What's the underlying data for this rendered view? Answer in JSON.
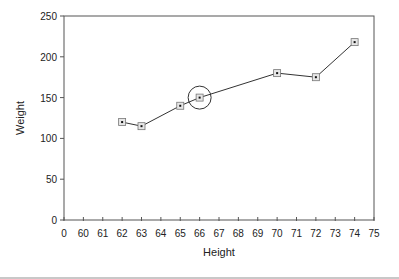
{
  "chart_data": {
    "type": "line",
    "title": "",
    "xlabel": "Height",
    "ylabel": "Weight",
    "x_tick_labels": [
      "0",
      "60",
      "61",
      "62",
      "63",
      "64",
      "65",
      "66",
      "67",
      "68",
      "69",
      "70",
      "71",
      "72",
      "73",
      "74",
      "75"
    ],
    "y_ticks": [
      0,
      50,
      100,
      150,
      200,
      250
    ],
    "ylim": [
      0,
      250
    ],
    "grid": false,
    "legend": null,
    "series": [
      {
        "name": "Weight vs Height",
        "marker": "square",
        "x": [
          62,
          63,
          65,
          66,
          70,
          72,
          74
        ],
        "y": [
          120,
          115,
          140,
          150,
          180,
          175,
          218
        ]
      }
    ],
    "annotations": [
      {
        "type": "circle",
        "x": 66,
        "y": 150,
        "note": "highlighted point"
      }
    ]
  },
  "colors": {
    "line": "#333333",
    "marker_fill": "#e6e6e6",
    "marker_edge": "#777777",
    "axis": "#555555"
  }
}
